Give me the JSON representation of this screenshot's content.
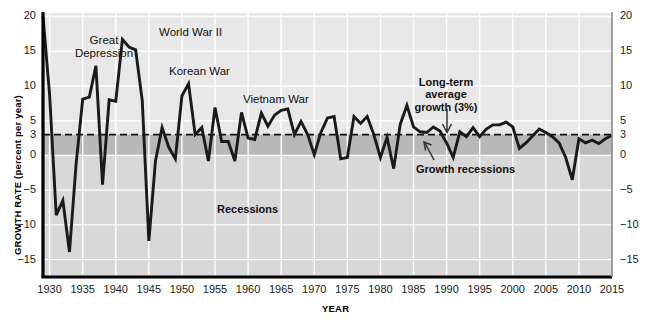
{
  "chart_data": {
    "type": "line",
    "title": "",
    "xlabel": "YEAR",
    "ylabel": "GROWTH RATE (percent per year)",
    "xlim": [
      1929,
      2015
    ],
    "ylim": [
      -17.5,
      20.5
    ],
    "grid": true,
    "legend": "none",
    "y_ticks": [
      20,
      15,
      10,
      5,
      3,
      0,
      -5,
      -10,
      -15
    ],
    "y_tick_labels": [
      "20",
      "15",
      "10",
      "5",
      "3",
      "0",
      "−5",
      "−10",
      "−15"
    ],
    "y_ticks_right": [
      20,
      15,
      10,
      5,
      3,
      0,
      -5,
      -10,
      -15
    ],
    "y_tick_labels_right": [
      "20",
      "15",
      "10",
      "5",
      "3",
      "0",
      "−5",
      "−10",
      "−15"
    ],
    "x_ticks": [
      1930,
      1935,
      1940,
      1945,
      1950,
      1955,
      1960,
      1965,
      1970,
      1975,
      1980,
      1985,
      1990,
      1995,
      2000,
      2005,
      2010,
      2015
    ],
    "x_tick_labels": [
      "1930",
      "1935",
      "1940",
      "1945",
      "1950",
      "1955",
      "1960",
      "1965",
      "1970",
      "1975",
      "1980",
      "1985",
      "1990",
      "1995",
      "2000",
      "2005",
      "2010",
      "2015"
    ],
    "reference_line": {
      "value": 3,
      "style": "dashed",
      "label": "Long-term average growth (3%)"
    },
    "bands": [
      {
        "name": "growth-recession-band",
        "from": 0,
        "to": 3,
        "color": "#b8b8b8"
      },
      {
        "name": "recession-band",
        "from": -17.5,
        "to": 0,
        "color": "#d8d8d8"
      }
    ],
    "series": [
      {
        "name": "Real GDP growth rate",
        "color": "#1a1a1a",
        "x": [
          1929,
          1930,
          1931,
          1932,
          1933,
          1934,
          1935,
          1936,
          1937,
          1938,
          1939,
          1940,
          1941,
          1942,
          1943,
          1944,
          1945,
          1946,
          1947,
          1948,
          1949,
          1950,
          1951,
          1952,
          1953,
          1954,
          1955,
          1956,
          1957,
          1958,
          1959,
          1960,
          1961,
          1962,
          1963,
          1964,
          1965,
          1966,
          1967,
          1968,
          1969,
          1970,
          1971,
          1972,
          1973,
          1974,
          1975,
          1976,
          1977,
          1978,
          1979,
          1980,
          1981,
          1982,
          1983,
          1984,
          1985,
          1986,
          1987,
          1988,
          1989,
          1990,
          1991,
          1992,
          1993,
          1994,
          1995,
          1996,
          1997,
          1998,
          1999,
          2000,
          2001,
          2002,
          2003,
          2004,
          2005,
          2006,
          2007,
          2008,
          2009,
          2010,
          2011,
          2012,
          2013,
          2014,
          2015
        ],
        "y": [
          20,
          8.7,
          -8.6,
          -6.5,
          -13.9,
          -1.3,
          8.1,
          8.4,
          12.9,
          -4.2,
          8.0,
          7.8,
          16.7,
          15.6,
          15.2,
          7.9,
          -12.3,
          -0.8,
          4.0,
          1.2,
          -0.5,
          8.6,
          10.3,
          3.0,
          4.0,
          -0.8,
          6.9,
          2.0,
          2.0,
          -0.8,
          6.2,
          2.5,
          2.3,
          6.1,
          4.2,
          5.8,
          6.5,
          6.7,
          3.0,
          4.9,
          3.0,
          0.1,
          3.3,
          5.4,
          5.6,
          -0.5,
          -0.3,
          5.6,
          4.6,
          5.6,
          3.0,
          -0.3,
          2.6,
          -1.9,
          4.5,
          7.2,
          4.1,
          3.4,
          3.3,
          4.1,
          3.5,
          1.8,
          -0.3,
          3.4,
          2.7,
          4.0,
          2.7,
          3.8,
          4.4,
          4.4,
          4.8,
          4.1,
          1.0,
          1.8,
          2.8,
          3.8,
          3.3,
          2.7,
          1.8,
          -0.3,
          -3.5,
          2.4,
          1.8,
          2.2,
          1.7,
          2.4,
          2.9
        ]
      }
    ],
    "annotations": [
      {
        "name": "great-depression",
        "text": "Great\nDepression",
        "x": 1933,
        "align": "center"
      },
      {
        "name": "world-war-ii",
        "text": "World War II",
        "x": 1942,
        "align": "center"
      },
      {
        "name": "korean-war",
        "text": "Korean War",
        "x": 1951.5,
        "align": "center"
      },
      {
        "name": "vietnam-war",
        "text": "Vietnam War",
        "x": 1964,
        "align": "center"
      },
      {
        "name": "recessions",
        "text": "Recessions",
        "x": 1967,
        "align": "center"
      },
      {
        "name": "long-term-average-growth",
        "text": "Long-term\naverage\ngrowth (3%)",
        "x": 1988,
        "align": "center"
      },
      {
        "name": "growth-recessions",
        "text": "Growth recessions",
        "x": 1991,
        "align": "center"
      }
    ]
  },
  "labels": {
    "y_axis_title": "GROWTH RATE (percent per year)",
    "x_axis_title": "YEAR",
    "great_depression_line1": "Great",
    "great_depression_line2": "Depression",
    "world_war_ii": "World War II",
    "korean_war": "Korean War",
    "vietnam_war": "Vietnam War",
    "recessions": "Recessions",
    "long_term_line1": "Long-term",
    "long_term_line2": "average",
    "long_term_line3": "growth (3%)",
    "growth_recessions": "Growth recessions"
  },
  "colors": {
    "line": "#1a1a1a",
    "recession_band": "#d8d8d8",
    "growth_recession_band": "#b8b8b8",
    "plot_bg": "#e8e8e8",
    "grid": "#ffffff",
    "axis": "#000000",
    "text": "#111111"
  }
}
